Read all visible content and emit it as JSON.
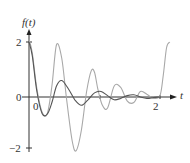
{
  "chart_data": {
    "type": "line",
    "title": "",
    "xlabel": "t",
    "ylabel": "f(t)",
    "xlim": [
      0,
      2.2
    ],
    "ylim": [
      -2,
      2.2
    ],
    "x_ticks": [
      0,
      1,
      2
    ],
    "x_tick_labels": [
      "0",
      "",
      "2"
    ],
    "y_ticks": [
      -2,
      0,
      2
    ],
    "y_tick_labels": [
      "−2",
      "0",
      "2"
    ],
    "grid": false,
    "legend": null,
    "series": [
      {
        "name": "f(t) light",
        "color": "#a8a8a8",
        "x": [
          0.0,
          0.05,
          0.12,
          0.2,
          0.28,
          0.35,
          0.42,
          0.5,
          0.58,
          0.66,
          0.72,
          0.8,
          0.88,
          0.95,
          1.0,
          1.05,
          1.12,
          1.2,
          1.3,
          1.4,
          1.5,
          1.6,
          1.7,
          1.8,
          1.9,
          2.0,
          2.05,
          2.1,
          2.15
        ],
        "y": [
          2.1,
          1.6,
          0.3,
          -0.55,
          -0.6,
          0.4,
          1.9,
          1.4,
          -0.2,
          -1.6,
          -1.95,
          -1.2,
          0.2,
          0.95,
          0.9,
          0.3,
          -0.3,
          -0.4,
          0.4,
          0.35,
          -0.15,
          -0.2,
          0.2,
          0.1,
          -0.05,
          0.05,
          0.8,
          1.8,
          2.0
        ]
      },
      {
        "name": "f(t) dark",
        "color": "#555555",
        "x": [
          0.0,
          0.05,
          0.12,
          0.2,
          0.28,
          0.35,
          0.42,
          0.5,
          0.6,
          0.7,
          0.8,
          0.9,
          1.0,
          1.1,
          1.2,
          1.3,
          1.4,
          1.5,
          1.6,
          1.7,
          1.8,
          1.9,
          2.0
        ],
        "y": [
          2.0,
          1.5,
          0.2,
          -0.6,
          -0.62,
          -0.2,
          0.4,
          0.6,
          0.3,
          -0.1,
          -0.3,
          -0.1,
          0.15,
          0.2,
          0.05,
          -0.1,
          -0.05,
          0.05,
          0.08,
          0.0,
          -0.05,
          -0.02,
          0.0
        ]
      }
    ]
  },
  "labels": {
    "y_axis": "f(t)",
    "x_axis": "t",
    "y_tick_top": "2",
    "y_tick_zero": "0",
    "y_tick_bottom": "−2",
    "x_tick_origin": "0",
    "x_tick_two": "2"
  }
}
